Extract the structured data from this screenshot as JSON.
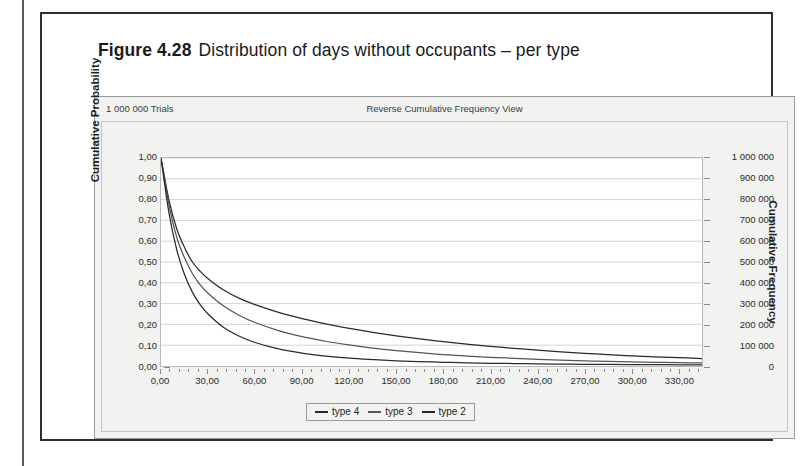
{
  "figure": {
    "number": "Figure 4.28",
    "caption": "Distribution of days without occupants – per type"
  },
  "chart_header": {
    "trials": "1 000 000 Trials",
    "view": "Reverse Cumulative Frequency View"
  },
  "legend": {
    "items": [
      {
        "label": "type 4",
        "color": "#2a2a2a"
      },
      {
        "label": "type 3",
        "color": "#555555"
      },
      {
        "label": "type 2",
        "color": "#2a2a2a"
      }
    ]
  },
  "chart_data": {
    "type": "line",
    "title": "Reverse Cumulative Frequency View",
    "subtitle": "1 000 000 Trials",
    "xlabel": "",
    "ylabel": "Cumulative Probability",
    "y2label": "Cumulative Frequency",
    "xlim": [
      0,
      345
    ],
    "ylim": [
      0,
      1
    ],
    "y2lim": [
      0,
      1000000
    ],
    "grid": "horizontal",
    "legend_position": "bottom-center",
    "xticks": [
      "0,00",
      "30,00",
      "60,00",
      "90,00",
      "120,00",
      "150,00",
      "180,00",
      "210,00",
      "240,00",
      "270,00",
      "300,00",
      "330,00"
    ],
    "xtick_values": [
      0,
      30,
      60,
      90,
      120,
      150,
      180,
      210,
      240,
      270,
      300,
      330
    ],
    "yticks": [
      "0,00",
      "0,10",
      "0,20",
      "0,30",
      "0,40",
      "0,50",
      "0,60",
      "0,70",
      "0,80",
      "0,90",
      "1,00"
    ],
    "ytick_values": [
      0,
      0.1,
      0.2,
      0.3,
      0.4,
      0.5,
      0.6,
      0.7,
      0.8,
      0.9,
      1.0
    ],
    "y2ticks": [
      "0",
      "100 000",
      "200 000",
      "300 000",
      "400 000",
      "500 000",
      "600 000",
      "700 000",
      "800 000",
      "900 000",
      "1 000 000"
    ],
    "y2tick_values": [
      0,
      100000,
      200000,
      300000,
      400000,
      500000,
      600000,
      700000,
      800000,
      900000,
      1000000
    ],
    "x": [
      0,
      5,
      10,
      15,
      20,
      25,
      30,
      40,
      50,
      60,
      75,
      90,
      105,
      120,
      135,
      150,
      165,
      180,
      195,
      210,
      225,
      240,
      255,
      270,
      285,
      300,
      315,
      330,
      345
    ],
    "series": [
      {
        "name": "type 4",
        "color": "#2a2a2a",
        "values": [
          1.0,
          0.8,
          0.66,
          0.57,
          0.5,
          0.455,
          0.42,
          0.365,
          0.325,
          0.295,
          0.258,
          0.228,
          0.203,
          0.181,
          0.162,
          0.145,
          0.13,
          0.117,
          0.105,
          0.094,
          0.085,
          0.076,
          0.068,
          0.061,
          0.055,
          0.049,
          0.044,
          0.04,
          0.036
        ]
      },
      {
        "name": "type 3",
        "color": "#555555",
        "values": [
          1.0,
          0.78,
          0.62,
          0.52,
          0.445,
          0.39,
          0.35,
          0.288,
          0.243,
          0.209,
          0.17,
          0.141,
          0.119,
          0.101,
          0.086,
          0.074,
          0.064,
          0.055,
          0.048,
          0.042,
          0.037,
          0.032,
          0.028,
          0.025,
          0.022,
          0.02,
          0.018,
          0.016,
          0.015
        ]
      },
      {
        "name": "type 2",
        "color": "#2a2a2a",
        "values": [
          1.0,
          0.74,
          0.56,
          0.44,
          0.355,
          0.295,
          0.25,
          0.185,
          0.143,
          0.113,
          0.082,
          0.062,
          0.048,
          0.038,
          0.031,
          0.025,
          0.021,
          0.018,
          0.015,
          0.013,
          0.012,
          0.01,
          0.009,
          0.008,
          0.008,
          0.007,
          0.007,
          0.006,
          0.006
        ]
      }
    ]
  }
}
